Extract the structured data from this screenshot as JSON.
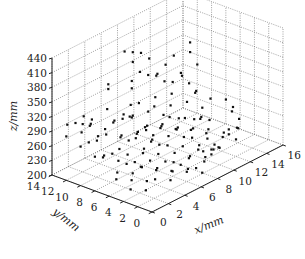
{
  "chart_data": {
    "type": "scatter3d",
    "title": "",
    "xlabel": "x/mm",
    "ylabel": "y/mm",
    "zlabel": "z/mm",
    "xlim": [
      0,
      16
    ],
    "ylim": [
      0,
      14
    ],
    "zlim": [
      200,
      440
    ],
    "xticks": [
      0,
      2,
      4,
      6,
      8,
      10,
      12,
      14,
      16
    ],
    "yticks": [
      0,
      2,
      4,
      6,
      8,
      10,
      12,
      14
    ],
    "zticks": [
      200,
      230,
      260,
      290,
      320,
      350,
      380,
      410,
      440
    ],
    "grid": true,
    "legend": null,
    "marker_color": "#111111",
    "points": [
      [
        1,
        13,
        300
      ],
      [
        2,
        13,
        295
      ],
      [
        2,
        12,
        298
      ],
      [
        3,
        12,
        290
      ],
      [
        4,
        13,
        285
      ],
      [
        3,
        13,
        300
      ],
      [
        5,
        12,
        303
      ],
      [
        6,
        13,
        340
      ],
      [
        6,
        13,
        330
      ],
      [
        1,
        10,
        280
      ],
      [
        2,
        10,
        275
      ],
      [
        3,
        11,
        270
      ],
      [
        4,
        11,
        265
      ],
      [
        5,
        10,
        260
      ],
      [
        6,
        11,
        280
      ],
      [
        7,
        12,
        275
      ],
      [
        8,
        12,
        260
      ],
      [
        9,
        13,
        250
      ],
      [
        2,
        9,
        250
      ],
      [
        3,
        9,
        245
      ],
      [
        4,
        8,
        240
      ],
      [
        5,
        9,
        255
      ],
      [
        6,
        9,
        260
      ],
      [
        7,
        10,
        250
      ],
      [
        8,
        10,
        245
      ],
      [
        9,
        11,
        240
      ],
      [
        10,
        12,
        255
      ],
      [
        3,
        7,
        235
      ],
      [
        4,
        7,
        230
      ],
      [
        5,
        7,
        240
      ],
      [
        6,
        8,
        235
      ],
      [
        7,
        8,
        245
      ],
      [
        8,
        9,
        240
      ],
      [
        9,
        9,
        250
      ],
      [
        10,
        10,
        240
      ],
      [
        11,
        11,
        245
      ],
      [
        4,
        6,
        225
      ],
      [
        5,
        6,
        230
      ],
      [
        6,
        6,
        235
      ],
      [
        7,
        7,
        240
      ],
      [
        8,
        7,
        230
      ],
      [
        9,
        8,
        235
      ],
      [
        10,
        8,
        240
      ],
      [
        11,
        9,
        230
      ],
      [
        12,
        10,
        235
      ],
      [
        5,
        5,
        220
      ],
      [
        6,
        5,
        225
      ],
      [
        7,
        5,
        215
      ],
      [
        8,
        6,
        220
      ],
      [
        9,
        6,
        225
      ],
      [
        10,
        7,
        230
      ],
      [
        11,
        7,
        220
      ],
      [
        12,
        8,
        225
      ],
      [
        13,
        9,
        230
      ],
      [
        6,
        4,
        210
      ],
      [
        7,
        4,
        215
      ],
      [
        8,
        4,
        220
      ],
      [
        9,
        5,
        210
      ],
      [
        10,
        5,
        215
      ],
      [
        11,
        6,
        210
      ],
      [
        12,
        6,
        215
      ],
      [
        13,
        7,
        220
      ],
      [
        14,
        8,
        225
      ],
      [
        7,
        3,
        212
      ],
      [
        8,
        3,
        205
      ],
      [
        9,
        3,
        210
      ],
      [
        10,
        4,
        205
      ],
      [
        11,
        4,
        212
      ],
      [
        12,
        5,
        208
      ],
      [
        13,
        5,
        215
      ],
      [
        14,
        6,
        210
      ],
      [
        8,
        12,
        320
      ],
      [
        8,
        12,
        335
      ],
      [
        9,
        12,
        345
      ],
      [
        9,
        13,
        360
      ],
      [
        8,
        13,
        390
      ],
      [
        9,
        13,
        380
      ],
      [
        10,
        13,
        370
      ],
      [
        10,
        12,
        330
      ],
      [
        11,
        12,
        320
      ],
      [
        11,
        13,
        350
      ],
      [
        12,
        13,
        310
      ],
      [
        12,
        12,
        300
      ],
      [
        13,
        12,
        290
      ],
      [
        13,
        13,
        320
      ],
      [
        14,
        13,
        330
      ],
      [
        14,
        12,
        300
      ],
      [
        15,
        13,
        280
      ],
      [
        15,
        12,
        270
      ],
      [
        15,
        11,
        260
      ],
      [
        16,
        12,
        300
      ],
      [
        16,
        13,
        340
      ],
      [
        16,
        13,
        320
      ],
      [
        14,
        10,
        270
      ],
      [
        13,
        10,
        260
      ],
      [
        12,
        11,
        280
      ],
      [
        11,
        10,
        270
      ],
      [
        10,
        11,
        290
      ],
      [
        9,
        10,
        285
      ],
      [
        8,
        11,
        295
      ],
      [
        7,
        11,
        300
      ],
      [
        6,
        10,
        290
      ],
      [
        5,
        11,
        285
      ],
      [
        4,
        10,
        295
      ],
      [
        3,
        10,
        290
      ],
      [
        2,
        11,
        300
      ],
      [
        1,
        11,
        295
      ],
      [
        0,
        12,
        290
      ],
      [
        0,
        10,
        280
      ],
      [
        0,
        8,
        270
      ],
      [
        1,
        8,
        260
      ],
      [
        9,
        2,
        230
      ],
      [
        9,
        2,
        240
      ],
      [
        10,
        2,
        235
      ],
      [
        9,
        1,
        250
      ],
      [
        8,
        2,
        245
      ],
      [
        12,
        3,
        240
      ],
      [
        12,
        3,
        250
      ],
      [
        13,
        3,
        245
      ],
      [
        12,
        2,
        235
      ],
      [
        14,
        4,
        230
      ],
      [
        15,
        5,
        235
      ],
      [
        15,
        6,
        245
      ],
      [
        16,
        7,
        240
      ],
      [
        16,
        8,
        250
      ],
      [
        15,
        9,
        255
      ],
      [
        14,
        9,
        245
      ],
      [
        13,
        8,
        240
      ],
      [
        10,
        9,
        260
      ],
      [
        11,
        8,
        255
      ],
      [
        12,
        7,
        250
      ],
      [
        11,
        5,
        240
      ],
      [
        10,
        6,
        250
      ],
      [
        9,
        7,
        255
      ],
      [
        8,
        8,
        260
      ],
      [
        7,
        9,
        265
      ],
      [
        6,
        7,
        255
      ],
      [
        5,
        8,
        265
      ],
      [
        4,
        9,
        270
      ],
      [
        3,
        8,
        260
      ],
      [
        2,
        7,
        250
      ],
      [
        1,
        6,
        240
      ],
      [
        2,
        5,
        235
      ],
      [
        3,
        5,
        240
      ],
      [
        4,
        4,
        230
      ],
      [
        5,
        3,
        225
      ],
      [
        6,
        2,
        220
      ],
      [
        7,
        1,
        215
      ],
      [
        4,
        2,
        220
      ],
      [
        3,
        3,
        225
      ],
      [
        2,
        3,
        230
      ],
      [
        1,
        4,
        235
      ],
      [
        0,
        5,
        240
      ],
      [
        0,
        3,
        230
      ],
      [
        1,
        2,
        225
      ]
    ]
  }
}
